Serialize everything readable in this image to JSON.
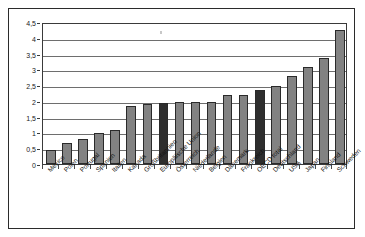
{
  "chart_data": {
    "type": "bar",
    "title": "",
    "subtitle": "",
    "xlabel": "",
    "ylabel": "",
    "ylim": [
      0,
      4.5
    ],
    "ytick_step": 0.5,
    "grid": true,
    "legend": "none",
    "decimal_separator": ",",
    "ytick_labels": [
      "0",
      "0,5",
      "1",
      "1,5",
      "2",
      "2,5",
      "3",
      "3,5",
      "4",
      "4,5"
    ],
    "ytick_values": [
      0,
      0.5,
      1,
      1.5,
      2,
      2.5,
      3,
      3.5,
      4,
      4.5
    ],
    "categories": [
      "Mexico",
      "Polen",
      "Portugal",
      "Spanien",
      "Italien",
      "Kanada",
      "Großbritannien",
      "Europäische Union",
      "Österreich",
      "Niederlande",
      "Belgien",
      "Dänemark",
      "Frankreich",
      "OECD total",
      "Deutschland",
      "USA",
      "Japan",
      "Finnland",
      "Schweden"
    ],
    "values": [
      0.45,
      0.67,
      0.79,
      0.98,
      1.08,
      1.85,
      1.9,
      1.93,
      1.97,
      1.96,
      1.96,
      2.19,
      2.19,
      2.33,
      2.48,
      2.79,
      3.07,
      3.37,
      4.24
    ],
    "highlighted": [
      "Europäische Union",
      "OECD total"
    ],
    "colors": {
      "bar_default": "#828282",
      "bar_highlight": "#2e2e2e",
      "bar_outline": "#2a2a2a",
      "gridline": "#6e6e6e",
      "axis": "#3a3a3a",
      "frame": "#2b2b2b",
      "background": "#ffffff",
      "text": "#111111"
    }
  }
}
